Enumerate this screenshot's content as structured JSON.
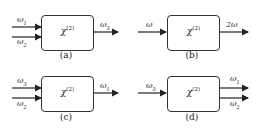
{
  "diagram": {
    "box_label": "χ",
    "box_label_sup": "(2)",
    "panels": [
      {
        "caption": "(a)",
        "inputs": [
          {
            "base": "ω",
            "sub": "1"
          },
          {
            "base": "ω",
            "sub": "2"
          }
        ],
        "outputs": [
          {
            "base": "ω",
            "sub": "3"
          }
        ]
      },
      {
        "caption": "(b)",
        "inputs": [
          {
            "base": "ω",
            "sub": ""
          }
        ],
        "outputs": [
          {
            "base": "2ω",
            "sub": ""
          }
        ]
      },
      {
        "caption": "(c)",
        "inputs": [
          {
            "base": "ω",
            "sub": "3"
          },
          {
            "base": "ω",
            "sub": "2"
          }
        ],
        "outputs": [
          {
            "base": "ω",
            "sub": "1"
          }
        ]
      },
      {
        "caption": "(d)",
        "inputs": [
          {
            "base": "ω",
            "sub": "3"
          }
        ],
        "outputs": [
          {
            "base": "ω",
            "sub": "1"
          },
          {
            "base": "ω",
            "sub": "2"
          }
        ]
      }
    ]
  }
}
